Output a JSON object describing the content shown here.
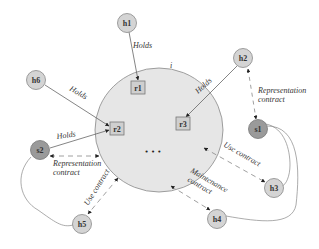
{
  "diagram": {
    "central_region": {
      "label": "i",
      "fill": "#e6e6e6"
    },
    "resources": [
      {
        "id": "r1",
        "label": "r1"
      },
      {
        "id": "r2",
        "label": "r2"
      },
      {
        "id": "r3",
        "label": "r3"
      }
    ],
    "ellipsis": "• • •",
    "holders": [
      {
        "id": "h1",
        "label": "h1"
      },
      {
        "id": "h2",
        "label": "h2"
      },
      {
        "id": "h3",
        "label": "h3"
      },
      {
        "id": "h4",
        "label": "h4"
      },
      {
        "id": "h5",
        "label": "h5"
      },
      {
        "id": "h6",
        "label": "h6"
      }
    ],
    "services": [
      {
        "id": "s1",
        "label": "s1"
      },
      {
        "id": "s2",
        "label": "s2"
      }
    ],
    "edge_labels": {
      "holds": "Holds",
      "representation_1": "Representation",
      "representation_2": "contract",
      "use_contract": "Use contract",
      "maintenance_1": "Maintenance",
      "maintenance_2": "contract"
    },
    "colors": {
      "holder_fill": "#d4d4d4",
      "service_fill": "#9a9a9a",
      "region_fill": "#e6e6e6",
      "line": "#666666"
    }
  }
}
